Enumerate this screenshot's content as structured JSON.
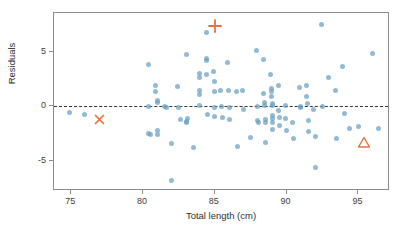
{
  "chart_data": {
    "type": "scatter",
    "title": "",
    "xlabel": "Total length (cm)",
    "ylabel": "Residuals",
    "xlim": [
      73.8,
      97.2
    ],
    "ylim": [
      -7.8,
      8.6
    ],
    "xticks": [
      75,
      80,
      85,
      90,
      95
    ],
    "yticks": [
      5,
      0,
      -5
    ],
    "xticklabels": [
      "75",
      "80",
      "85",
      "90",
      "95"
    ],
    "yticklabels": [
      "5",
      "0",
      "-5"
    ],
    "grid": false,
    "legend": null,
    "reference_lines": [
      {
        "name": "zero-residual-line",
        "orientation": "horizontal",
        "y": 0,
        "style": "dashed",
        "color": "#33333a"
      }
    ],
    "series": [
      {
        "name": "residuals",
        "marker": "circle",
        "color": "#6a9fc0",
        "opacity": 0.72,
        "points": [
          [
            74.9,
            -0.6
          ],
          [
            75.9,
            -0.75
          ],
          [
            80.4,
            3.9
          ],
          [
            80.4,
            0.0
          ],
          [
            80.4,
            -2.5
          ],
          [
            80.5,
            -2.6
          ],
          [
            80.9,
            1.9
          ],
          [
            80.9,
            1.4
          ],
          [
            81.0,
            0.5
          ],
          [
            81.0,
            0.35
          ],
          [
            81.0,
            -2.2
          ],
          [
            81.0,
            -2.6
          ],
          [
            81.5,
            0.0
          ],
          [
            81.6,
            -0.1
          ],
          [
            82.0,
            -3.4
          ],
          [
            82.0,
            -6.8
          ],
          [
            82.4,
            1.8
          ],
          [
            82.5,
            -0.1
          ],
          [
            82.6,
            -1.2
          ],
          [
            83.0,
            4.8
          ],
          [
            83.0,
            -1.4
          ],
          [
            83.05,
            -1.5
          ],
          [
            83.1,
            -1.1
          ],
          [
            83.5,
            -3.8
          ],
          [
            83.9,
            3.0
          ],
          [
            83.9,
            2.7
          ],
          [
            83.95,
            1.5
          ],
          [
            83.95,
            1.1
          ],
          [
            83.95,
            0.1
          ],
          [
            84.4,
            6.8
          ],
          [
            84.4,
            4.4
          ],
          [
            84.45,
            4.2
          ],
          [
            84.45,
            2.9
          ],
          [
            84.5,
            -0.75
          ],
          [
            84.9,
            3.2
          ],
          [
            84.95,
            2.3
          ],
          [
            84.95,
            1.4
          ],
          [
            85.0,
            -0.1
          ],
          [
            85.0,
            -0.9
          ],
          [
            85.4,
            1.5
          ],
          [
            85.45,
            0.0
          ],
          [
            85.5,
            -1.0
          ],
          [
            85.9,
            4.0
          ],
          [
            85.95,
            1.5
          ],
          [
            86.0,
            -0.1
          ],
          [
            86.0,
            -1.2
          ],
          [
            86.5,
            1.4
          ],
          [
            86.6,
            -3.7
          ],
          [
            86.9,
            1.5
          ],
          [
            87.0,
            -0.3
          ],
          [
            87.5,
            -2.9
          ],
          [
            87.9,
            5.1
          ],
          [
            88.0,
            0.0
          ],
          [
            88.0,
            -1.3
          ],
          [
            88.05,
            -1.5
          ],
          [
            88.4,
            4.3
          ],
          [
            88.4,
            1.2
          ],
          [
            88.45,
            0.4
          ],
          [
            88.45,
            0.1
          ],
          [
            88.5,
            -1.2
          ],
          [
            88.5,
            -1.5
          ],
          [
            88.5,
            -3.3
          ],
          [
            88.9,
            2.9
          ],
          [
            88.95,
            1.6
          ],
          [
            88.95,
            1.4
          ],
          [
            88.95,
            0.9
          ],
          [
            89.0,
            0.3
          ],
          [
            89.0,
            0.1
          ],
          [
            89.0,
            -0.8
          ],
          [
            89.0,
            -1.1
          ],
          [
            89.05,
            -1.5
          ],
          [
            89.05,
            -2.1
          ],
          [
            89.4,
            1.9
          ],
          [
            89.45,
            -0.4
          ],
          [
            89.5,
            -1.0
          ],
          [
            89.5,
            -1.8
          ],
          [
            89.9,
            0.1
          ],
          [
            89.95,
            -1.1
          ],
          [
            90.0,
            -2.2
          ],
          [
            90.4,
            -1.5
          ],
          [
            90.5,
            -3.0
          ],
          [
            90.9,
            1.7
          ],
          [
            90.95,
            0.0
          ],
          [
            91.0,
            -0.1
          ],
          [
            91.4,
            1.9
          ],
          [
            91.4,
            0.9
          ],
          [
            91.45,
            0.3
          ],
          [
            91.5,
            -1.3
          ],
          [
            91.5,
            -2.3
          ],
          [
            91.9,
            -0.3
          ],
          [
            92.0,
            -2.8
          ],
          [
            92.0,
            -5.6
          ],
          [
            92.4,
            7.5
          ],
          [
            92.5,
            0.0
          ],
          [
            92.9,
            2.7
          ],
          [
            93.4,
            1.5
          ],
          [
            93.5,
            -3.0
          ],
          [
            93.9,
            3.7
          ],
          [
            94.0,
            -0.7
          ],
          [
            94.4,
            -2.0
          ],
          [
            95.0,
            -1.9
          ],
          [
            96.0,
            4.9
          ],
          [
            96.4,
            -2.0
          ]
        ]
      }
    ],
    "highlighted_markers": [
      {
        "name": "plus-marker",
        "shape": "plus",
        "x": 85.0,
        "y": 7.4,
        "color": "#e2733f"
      },
      {
        "name": "cross-marker",
        "shape": "x",
        "x": 76.95,
        "y": -1.2,
        "color": "#e2733f"
      },
      {
        "name": "triangle-marker",
        "shape": "triangle",
        "x": 95.4,
        "y": -3.3,
        "color": "#e2733f"
      }
    ]
  },
  "colors": {
    "point": "#6a9fc0",
    "highlight": "#e2733f",
    "axis": "#8c8c8c",
    "zero_line": "#33333a",
    "text": "#2e2e2e",
    "background": "#ffffff"
  }
}
